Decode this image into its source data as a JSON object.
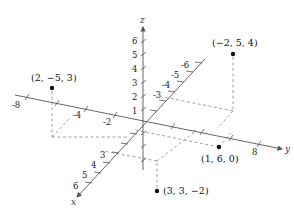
{
  "figure": {
    "type": "3d-coordinate-plot",
    "axes": {
      "x": {
        "name": "x",
        "tick_labels": [
          "3",
          "4",
          "5",
          "6",
          "-3",
          "-4",
          "-5",
          "-6"
        ]
      },
      "y": {
        "name": "y",
        "tick_labels": [
          "-8",
          "-4",
          "-2",
          "8"
        ]
      },
      "z": {
        "name": "z",
        "tick_labels": [
          "1",
          "2",
          "3",
          "4",
          "5",
          "6"
        ]
      }
    },
    "points": [
      {
        "label": "(−2, 5, 4)",
        "coords": [
          -2,
          5,
          4
        ]
      },
      {
        "label": "(2, −5, 3)",
        "coords": [
          2,
          -5,
          3
        ]
      },
      {
        "label": "(1, 6, 0)",
        "coords": [
          1,
          6,
          0
        ]
      },
      {
        "label": "(3, 3, −2)",
        "coords": [
          3,
          3,
          -2
        ]
      }
    ]
  }
}
